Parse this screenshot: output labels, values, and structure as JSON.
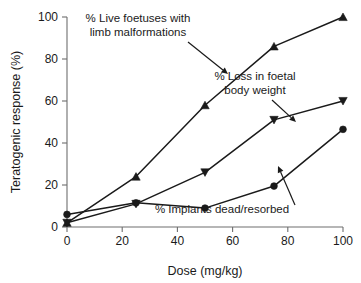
{
  "chart_data": {
    "type": "line",
    "title": "",
    "subtitle": "",
    "xlabel": "Dose (mg/kg)",
    "ylabel": "Teratogenic response (%)",
    "xlim": [
      0,
      100
    ],
    "ylim": [
      0,
      100
    ],
    "xticks": [
      "0",
      "20",
      "40",
      "60",
      "80",
      "100"
    ],
    "xtick_values": [
      0,
      20,
      40,
      60,
      80,
      100
    ],
    "yticks": [
      "0",
      "20",
      "40",
      "60",
      "80",
      "100"
    ],
    "ytick_values": [
      0,
      20,
      40,
      60,
      80,
      100
    ],
    "grid": false,
    "legend": "none",
    "x": [
      0,
      25,
      50,
      75,
      100
    ],
    "series": [
      {
        "name": "% Live foetuses with limb malformations",
        "marker": "triangle-up",
        "color": "#1a1a1a",
        "values": [
          2,
          24,
          58,
          86,
          100
        ]
      },
      {
        "name": "% Loss in foetal body weight",
        "marker": "triangle-down",
        "color": "#1a1a1a",
        "values": [
          2,
          11,
          26,
          51,
          60
        ]
      },
      {
        "name": "% Implants dead/resorbed",
        "marker": "circle",
        "color": "#1a1a1a",
        "values": [
          6,
          11.5,
          9,
          19.5,
          46.5
        ]
      }
    ],
    "annotations": [
      {
        "id": "annotation-live-foetuses",
        "lines": [
          "% Live foetuses with",
          "limb malformations"
        ],
        "text_anchor_px": {
          "x": 138,
          "y": 22
        },
        "arrow_from_px": {
          "x": 188,
          "y": 42
        },
        "arrow_to_px": {
          "x": 228,
          "y": 74
        }
      },
      {
        "id": "annotation-loss-body-weight",
        "lines": [
          "% Loss in foetal",
          "body weight"
        ],
        "text_anchor_px": {
          "x": 255,
          "y": 80
        },
        "arrow_from_px": {
          "x": 272,
          "y": 100
        },
        "arrow_to_px": {
          "x": 296,
          "y": 122
        }
      },
      {
        "id": "annotation-implants-dead",
        "lines": [
          "% Implants dead/resorbed"
        ],
        "text_anchor_px": {
          "x": 222,
          "y": 213
        },
        "arrow_from_px": {
          "x": 295,
          "y": 205
        },
        "arrow_to_px": {
          "x": 278,
          "y": 166
        }
      }
    ]
  },
  "axes": {
    "x_title": "Dose (mg/kg)",
    "y_title": "Teratogenic response (%)"
  }
}
